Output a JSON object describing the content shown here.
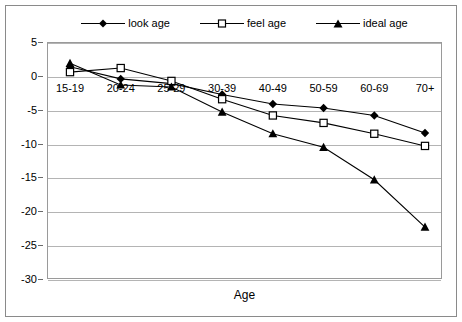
{
  "chart_data": {
    "type": "line",
    "title": "",
    "xlabel": "Age",
    "ylabel": "",
    "categories": [
      "15-19",
      "20-24",
      "25-29",
      "30-39",
      "40-49",
      "50-59",
      "60-69",
      "70+"
    ],
    "ylim": [
      -30,
      5
    ],
    "yticks": [
      5,
      0,
      -5,
      -10,
      -15,
      -20,
      -25,
      -30
    ],
    "grid": "horizontal",
    "legend_position": "top-center",
    "series": [
      {
        "name": "look age",
        "marker": "filled-diamond",
        "values": [
          1.5,
          -0.3,
          -1.0,
          -2.6,
          -4.0,
          -4.6,
          -5.7,
          -8.3
        ]
      },
      {
        "name": "feel age",
        "marker": "open-square",
        "values": [
          0.7,
          1.3,
          -0.6,
          -3.3,
          -5.7,
          -6.8,
          -8.4,
          -10.2
        ]
      },
      {
        "name": "ideal age",
        "marker": "filled-triangle",
        "values": [
          2.0,
          -1.2,
          -1.5,
          -5.2,
          -8.4,
          -10.4,
          -15.2,
          -22.2
        ]
      }
    ]
  },
  "legend": {
    "items": [
      {
        "label": "look age",
        "marker": "filled-diamond"
      },
      {
        "label": "feel age",
        "marker": "open-square"
      },
      {
        "label": "ideal age",
        "marker": "filled-triangle"
      }
    ]
  },
  "axis": {
    "x_title": "Age"
  },
  "colors": {
    "series": "#000000",
    "gridline": "#b4b4b4",
    "frame": "#9a9a9a",
    "outer_border": "#8a8a8a",
    "background": "#ffffff"
  }
}
